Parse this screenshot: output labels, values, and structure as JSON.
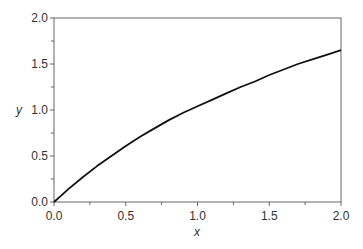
{
  "chart_data": {
    "type": "line",
    "title": "",
    "xlabel": "x",
    "ylabel": "y",
    "xlim": [
      0.0,
      2.0
    ],
    "ylim": [
      0.0,
      2.0
    ],
    "grid": false,
    "legend": null,
    "x_ticks": [
      "0.0",
      "0.5",
      "1.0",
      "1.5",
      "2.0"
    ],
    "y_ticks": [
      "0.0",
      "0.5",
      "1.0",
      "1.5",
      "2.0"
    ],
    "x_minor_ticks": [
      0.25,
      0.75,
      1.25,
      1.75
    ],
    "y_minor_ticks": [
      0.25,
      0.75,
      1.25,
      1.75
    ],
    "series": [
      {
        "name": "y(x)",
        "color": "#111111",
        "x": [
          0.0,
          0.05,
          0.1,
          0.2,
          0.3,
          0.4,
          0.5,
          0.6,
          0.7,
          0.8,
          0.9,
          1.0,
          1.1,
          1.2,
          1.3,
          1.4,
          1.5,
          1.6,
          1.7,
          1.8,
          1.9,
          2.0
        ],
        "y": [
          0.0,
          0.07,
          0.14,
          0.27,
          0.39,
          0.5,
          0.61,
          0.71,
          0.8,
          0.89,
          0.97,
          1.04,
          1.11,
          1.18,
          1.25,
          1.31,
          1.38,
          1.44,
          1.5,
          1.55,
          1.6,
          1.65
        ]
      }
    ]
  },
  "plot_area": {
    "left": 54,
    "top": 18,
    "right": 341,
    "bottom": 202
  },
  "colors": {
    "frame": "#666666",
    "curve": "#111111",
    "text": "#333333"
  }
}
